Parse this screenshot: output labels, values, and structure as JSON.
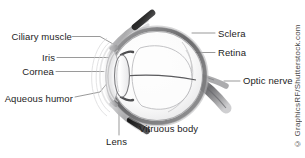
{
  "figure": {
    "background_color": "#ffffff",
    "text_color": "#1c1c1c",
    "leader_line_color": "#6e6e6e",
    "labels": [
      {
        "id": "ciliary-muscle",
        "text": "Ciliary muscle",
        "side": "left"
      },
      {
        "id": "iris",
        "text": "Iris",
        "side": "left"
      },
      {
        "id": "cornea",
        "text": "Cornea",
        "side": "left"
      },
      {
        "id": "aqueous-humor",
        "text": "Aqueous humor",
        "side": "left"
      },
      {
        "id": "lens",
        "text": "Lens",
        "side": "bottom"
      },
      {
        "id": "vitruous-body",
        "text": "Vitruous body",
        "side": "bottom"
      },
      {
        "id": "sclera",
        "text": "Sclera",
        "side": "right"
      },
      {
        "id": "retina",
        "text": "Retina",
        "side": "right"
      },
      {
        "id": "optic-nerve",
        "text": "Optic nerve",
        "side": "right"
      }
    ],
    "credit": "© GraphicsRF/Shutterstock.com"
  }
}
